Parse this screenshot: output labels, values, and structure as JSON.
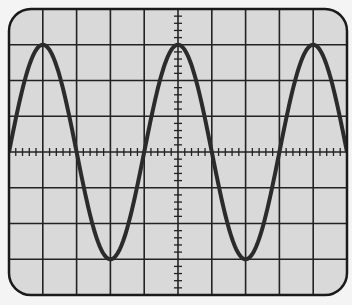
{
  "colors": {
    "page_background": "#f4f4f4",
    "screen_background": "#d9d9d9",
    "grid_line": "#222222",
    "trace": "#2b2b2b",
    "frame": "#1a1a1a"
  },
  "screen": {
    "left": 9,
    "top": 9,
    "right": 347,
    "bottom": 295,
    "corner_radius": 22,
    "divisions_x": 10,
    "divisions_y": 8,
    "minor_ticks_per_division": 5,
    "center_x": 179,
    "center_y": 152
  },
  "waveform": {
    "type": "sine",
    "amplitude_divisions": 3,
    "period_divisions": 4,
    "phase": "starts at center line rising at left edge",
    "cycles_visible": 2.5,
    "peaks_x_divisions": [
      1,
      5,
      9
    ],
    "troughs_x_divisions": [
      3,
      7
    ]
  }
}
